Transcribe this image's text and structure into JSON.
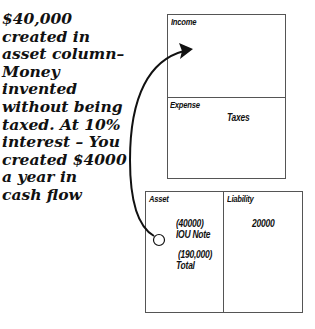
{
  "caption": {
    "lines": "$40,000\ncreated in\nasset column–\nMoney\ninvented\nwithout being\ntaxed. At 10%\ninterest – You\ncreated $4000\na year in\ncash flow"
  },
  "income_statement": {
    "income": {
      "label": "Income"
    },
    "expense": {
      "label": "Expense",
      "items": [
        "Taxes"
      ]
    }
  },
  "balance_sheet": {
    "asset": {
      "label": "Asset",
      "items": [
        {
          "amount": "(40000)",
          "name": "IOU Note"
        },
        {
          "amount": "(190,000)",
          "name": "Total"
        }
      ]
    },
    "liability": {
      "label": "Liability",
      "items": [
        {
          "amount": "20000"
        }
      ]
    }
  },
  "arrow": {
    "from": "asset-iou-note",
    "to": "income",
    "color": "#111111"
  },
  "colors": {
    "text": "#111111",
    "border": "#555555",
    "background": "#ffffff"
  }
}
